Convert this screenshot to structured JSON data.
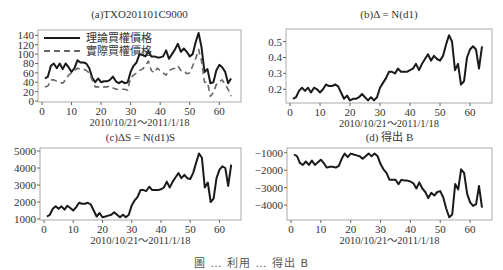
{
  "caption": "圖 … 利用 … 得出 B",
  "x_range_label": "2010/10/21～2011/1/18",
  "chart_data": [
    {
      "id": "a",
      "type": "line",
      "title": "(a)TXO201101C9000",
      "xlabel": "2010/10/21～2011/1/18",
      "ylabel": "",
      "xlim": [
        0,
        66
      ],
      "ylim": [
        0,
        145
      ],
      "xticks": [
        0,
        10,
        20,
        30,
        40,
        50,
        60
      ],
      "yticks": [
        0,
        20,
        40,
        60,
        80,
        100,
        120,
        140
      ],
      "legend_position": "upper left",
      "x": [
        1,
        2,
        3,
        4,
        5,
        6,
        7,
        8,
        9,
        10,
        11,
        12,
        13,
        14,
        15,
        16,
        17,
        18,
        19,
        20,
        21,
        22,
        23,
        24,
        25,
        26,
        27,
        28,
        29,
        30,
        31,
        32,
        33,
        34,
        35,
        36,
        37,
        38,
        39,
        40,
        41,
        42,
        43,
        44,
        45,
        46,
        47,
        48,
        49,
        50,
        51,
        52,
        53,
        54,
        55,
        56,
        57,
        58,
        59,
        60,
        61,
        62,
        63,
        64
      ],
      "series": [
        {
          "name": "理論買權價格",
          "style": "solid",
          "values": [
            48,
            52,
            75,
            80,
            70,
            80,
            68,
            80,
            72,
            62,
            70,
            87,
            82,
            82,
            80,
            70,
            50,
            40,
            48,
            40,
            42,
            42,
            45,
            52,
            42,
            38,
            42,
            38,
            40,
            62,
            75,
            82,
            100,
            98,
            95,
            105,
            95,
            95,
            93,
            93,
            95,
            108,
            90,
            100,
            110,
            122,
            105,
            112,
            105,
            95,
            100,
            125,
            145,
            115,
            62,
            68,
            38,
            40,
            65,
            77,
            72,
            62,
            38,
            48
          ]
        },
        {
          "name": "實際買權價格",
          "style": "dashed",
          "values": [
            30,
            32,
            45,
            45,
            42,
            40,
            38,
            45,
            55,
            60,
            65,
            70,
            68,
            68,
            65,
            60,
            45,
            30,
            30,
            28,
            30,
            30,
            32,
            28,
            25,
            25,
            25,
            25,
            23,
            50,
            55,
            60,
            65,
            68,
            75,
            85,
            65,
            60,
            70,
            65,
            60,
            55,
            65,
            68,
            70,
            75,
            65,
            65,
            58,
            60,
            75,
            90,
            110,
            85,
            40,
            40,
            10,
            18,
            35,
            42,
            45,
            35,
            25,
            10
          ]
        }
      ]
    },
    {
      "id": "b",
      "type": "line",
      "title": "(b)Δ = N(d1)",
      "xlabel": "2010/10/21～2011/1/18",
      "ylabel": "",
      "xlim": [
        0,
        66
      ],
      "ylim": [
        0.12,
        0.56
      ],
      "xticks": [
        0,
        10,
        20,
        30,
        40,
        50,
        60
      ],
      "yticks": [
        0.2,
        0.3,
        0.4,
        0.5
      ],
      "x": [
        1,
        2,
        3,
        4,
        5,
        6,
        7,
        8,
        9,
        10,
        11,
        12,
        13,
        14,
        15,
        16,
        17,
        18,
        19,
        20,
        21,
        22,
        23,
        24,
        25,
        26,
        27,
        28,
        29,
        30,
        31,
        32,
        33,
        34,
        35,
        36,
        37,
        38,
        39,
        40,
        41,
        42,
        43,
        44,
        45,
        46,
        47,
        48,
        49,
        50,
        51,
        52,
        53,
        54,
        55,
        56,
        57,
        58,
        59,
        60,
        61,
        62,
        63,
        64
      ],
      "series": [
        {
          "name": "Δ",
          "values": [
            0.14,
            0.15,
            0.19,
            0.21,
            0.19,
            0.21,
            0.18,
            0.21,
            0.2,
            0.18,
            0.2,
            0.23,
            0.22,
            0.22,
            0.23,
            0.22,
            0.18,
            0.14,
            0.16,
            0.13,
            0.14,
            0.14,
            0.15,
            0.17,
            0.15,
            0.13,
            0.15,
            0.13,
            0.15,
            0.21,
            0.24,
            0.27,
            0.31,
            0.31,
            0.3,
            0.33,
            0.31,
            0.31,
            0.31,
            0.32,
            0.33,
            0.36,
            0.32,
            0.36,
            0.39,
            0.42,
            0.38,
            0.41,
            0.39,
            0.38,
            0.41,
            0.48,
            0.54,
            0.5,
            0.32,
            0.36,
            0.23,
            0.25,
            0.4,
            0.45,
            0.47,
            0.45,
            0.33,
            0.47
          ]
        }
      ]
    },
    {
      "id": "c",
      "type": "line",
      "title": "(c)ΔS = N(d1)S",
      "xlabel": "2010/10/21～2011/1/18",
      "ylabel": "",
      "xlim": [
        0,
        66
      ],
      "ylim": [
        1000,
        5000
      ],
      "xticks": [
        0,
        10,
        20,
        30,
        40,
        50,
        60
      ],
      "yticks": [
        1000,
        2000,
        3000,
        4000,
        5000
      ],
      "x": [
        1,
        2,
        3,
        4,
        5,
        6,
        7,
        8,
        9,
        10,
        11,
        12,
        13,
        14,
        15,
        16,
        17,
        18,
        19,
        20,
        21,
        22,
        23,
        24,
        25,
        26,
        27,
        28,
        29,
        30,
        31,
        32,
        33,
        34,
        35,
        36,
        37,
        38,
        39,
        40,
        41,
        42,
        43,
        44,
        45,
        46,
        47,
        48,
        49,
        50,
        51,
        52,
        53,
        54,
        55,
        56,
        57,
        58,
        59,
        60,
        61,
        62,
        63,
        64
      ],
      "series": [
        {
          "name": "ΔS",
          "values": [
            1150,
            1250,
            1600,
            1750,
            1600,
            1750,
            1550,
            1780,
            1650,
            1500,
            1700,
            1950,
            1900,
            1900,
            1950,
            1850,
            1500,
            1150,
            1350,
            1100,
            1150,
            1200,
            1250,
            1400,
            1250,
            1100,
            1250,
            1100,
            1250,
            1800,
            2100,
            2300,
            2700,
            2700,
            2650,
            2900,
            2700,
            2700,
            2700,
            2750,
            2850,
            3200,
            2850,
            3200,
            3450,
            3700,
            3400,
            3600,
            3400,
            3350,
            3700,
            4300,
            4850,
            4600,
            2850,
            3150,
            2000,
            2200,
            3400,
            3900,
            4100,
            4000,
            2950,
            4200
          ]
        }
      ]
    },
    {
      "id": "d",
      "type": "line",
      "title": "(d) 得出 B",
      "xlabel": "2010/10/21～2011/1/18",
      "ylabel": "",
      "xlim": [
        0,
        66
      ],
      "ylim": [
        -4800,
        -900
      ],
      "xticks": [
        0,
        10,
        20,
        30,
        40,
        50,
        60
      ],
      "yticks": [
        -1000,
        -2000,
        -3000,
        -4000
      ],
      "x": [
        1,
        2,
        3,
        4,
        5,
        6,
        7,
        8,
        9,
        10,
        11,
        12,
        13,
        14,
        15,
        16,
        17,
        18,
        19,
        20,
        21,
        22,
        23,
        24,
        25,
        26,
        27,
        28,
        29,
        30,
        31,
        32,
        33,
        34,
        35,
        36,
        37,
        38,
        39,
        40,
        41,
        42,
        43,
        44,
        45,
        46,
        47,
        48,
        49,
        50,
        51,
        52,
        53,
        54,
        55,
        56,
        57,
        58,
        59,
        60,
        61,
        62,
        63,
        64
      ],
      "series": [
        {
          "name": "B",
          "values": [
            -1100,
            -1200,
            -1600,
            -1700,
            -1500,
            -1700,
            -1450,
            -1700,
            -1550,
            -1400,
            -1600,
            -1850,
            -1800,
            -1800,
            -1850,
            -1750,
            -1350,
            -1050,
            -1250,
            -1050,
            -1100,
            -1150,
            -1200,
            -1350,
            -1200,
            -1050,
            -1200,
            -1050,
            -1200,
            -1650,
            -1950,
            -2150,
            -2550,
            -2550,
            -2550,
            -2800,
            -2550,
            -2600,
            -2600,
            -2650,
            -2750,
            -3050,
            -2700,
            -3050,
            -3250,
            -3600,
            -3300,
            -3450,
            -3250,
            -3200,
            -3550,
            -4200,
            -4700,
            -4550,
            -2800,
            -3100,
            -1950,
            -2150,
            -3350,
            -3850,
            -4050,
            -3950,
            -2900,
            -4150
          ]
        }
      ]
    }
  ]
}
